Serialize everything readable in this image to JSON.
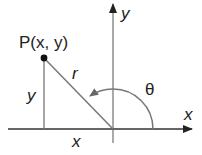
{
  "diagram": {
    "colors": {
      "axis": "#333333",
      "line": "#777777",
      "arc": "#777777",
      "point": "#111111",
      "text": "#222222"
    },
    "labels": {
      "point": "P(x, y)",
      "radius": "r",
      "vertical_leg": "y",
      "horizontal_leg": "x",
      "angle": "θ",
      "x_axis": "x",
      "y_axis": "y"
    },
    "geometry": {
      "origin": [
        113,
        129
      ],
      "point_P": [
        44,
        58
      ],
      "arc_radius": 40
    }
  }
}
